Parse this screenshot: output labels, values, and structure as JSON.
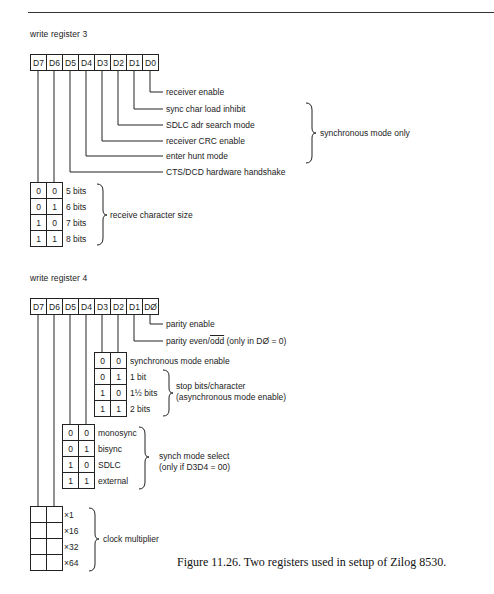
{
  "page": {
    "header_rule": true
  },
  "register3": {
    "title": "write  register 3",
    "bits": [
      "D7",
      "D6",
      "D5",
      "D4",
      "D3",
      "D2",
      "D1",
      "D0"
    ],
    "fields": [
      {
        "bit": "D0",
        "label": "receiver enable"
      },
      {
        "bit": "D1",
        "label": "sync char load inhibit"
      },
      {
        "bit": "D2",
        "label": "SDLC adr search mode"
      },
      {
        "bit": "D3",
        "label": "receiver CRC enable"
      },
      {
        "bit": "D4",
        "label": "enter hunt mode"
      },
      {
        "bit": "D5",
        "label": "CTS/DCD hardware handshake"
      }
    ],
    "sync_group_label": "synchronous mode only",
    "char_size": {
      "bits": "D7 D6",
      "rows": [
        {
          "d7": "0",
          "d6": "0",
          "label": "5 bits"
        },
        {
          "d7": "0",
          "d6": "1",
          "label": "6 bits"
        },
        {
          "d7": "1",
          "d6": "0",
          "label": "7 bits"
        },
        {
          "d7": "1",
          "d6": "1",
          "label": "8 bits"
        }
      ],
      "group_label": "receive character size"
    }
  },
  "register4": {
    "title": "write  register 4",
    "bits": [
      "D7",
      "D6",
      "D5",
      "D4",
      "D3",
      "D2",
      "D1",
      "DØ"
    ],
    "fields": [
      {
        "bit": "D0",
        "label": "parity enable"
      },
      {
        "bit": "D1",
        "label_pre": "parity even/",
        "label_over": "odd",
        "label_post": " (only in DØ = 0)"
      }
    ],
    "stop_bits": {
      "rows": [
        {
          "d3": "0",
          "d2": "0",
          "label": "synchronous mode enable"
        },
        {
          "d3": "0",
          "d2": "1",
          "label": "1 bit"
        },
        {
          "d3": "1",
          "d2": "0",
          "label": "1½ bits"
        },
        {
          "d3": "1",
          "d2": "1",
          "label": "2 bits"
        }
      ],
      "group_label_1": "stop bits/character",
      "group_label_2": "(asynchronous mode enable)"
    },
    "sync_mode": {
      "rows": [
        {
          "d5": "0",
          "d4": "0",
          "label": "monosync"
        },
        {
          "d5": "0",
          "d4": "1",
          "label": "bisync"
        },
        {
          "d5": "1",
          "d4": "0",
          "label": "SDLC"
        },
        {
          "d5": "1",
          "d4": "1",
          "label": "external"
        }
      ],
      "group_label_1": "synch mode select",
      "group_label_2": "(only if D3D4 = 00)"
    },
    "clock": {
      "rows": [
        {
          "d7": "",
          "d6": "",
          "label": "×1"
        },
        {
          "d7": "",
          "d6": "",
          "label": "×16"
        },
        {
          "d7": "",
          "d6": "",
          "label": "×32"
        },
        {
          "d7": "",
          "d6": "",
          "label": "×64"
        }
      ],
      "group_label": "clock multiplier"
    }
  },
  "caption": "Figure 11.26. Two registers used in setup of Zilog 8530."
}
